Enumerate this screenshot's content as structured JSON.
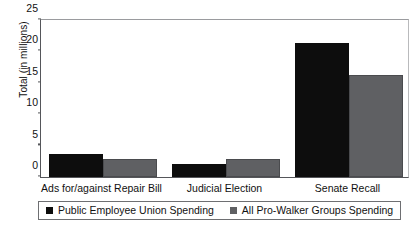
{
  "chart_data": {
    "type": "bar",
    "title": "",
    "xlabel": "",
    "ylabel": "Total (in millions)",
    "categories": [
      "Ads for/against Repair Bill",
      "Judicial Election",
      "Senate Recall"
    ],
    "series": [
      {
        "name": "Public Employee Union Spending",
        "color": "#0d0d0d",
        "values": [
          3.6,
          2.0,
          21.0
        ]
      },
      {
        "name": "All Pro-Walker Groups Spending",
        "color": "#5f6063",
        "values": [
          2.9,
          2.9,
          16.0
        ]
      }
    ],
    "ylim": [
      0,
      25
    ],
    "yticks": [
      0,
      5,
      10,
      15,
      20,
      25
    ],
    "grid": false,
    "legend_position": "bottom"
  }
}
